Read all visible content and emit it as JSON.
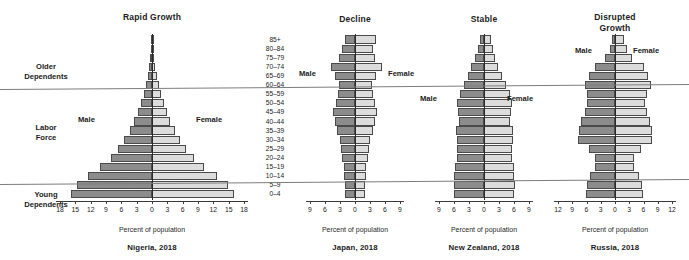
{
  "figure": {
    "shared_axis_label": "Percent of population",
    "series_names": {
      "male": "Male",
      "female": "Female"
    },
    "age_groups": [
      "85+",
      "80–84",
      "75–79",
      "70–74",
      "65–69",
      "60–64",
      "55–59",
      "50–54",
      "45–49",
      "40–44",
      "35–39",
      "30–34",
      "25–29",
      "20–24",
      "15–19",
      "10–14",
      "5–9",
      "0–4"
    ],
    "category_bands": [
      {
        "label": "Older\nDependents"
      },
      {
        "label": "Labor\nForce"
      },
      {
        "label": "Young\nDependents"
      }
    ],
    "colors": {
      "male": "#8c8c8c",
      "female": "#dcdcdc",
      "outline": "#4a4a4a",
      "axis": "#3a3a3a",
      "divider": "#7d7d7d"
    }
  },
  "chart_data": [
    {
      "type": "bar",
      "title": "Rapid Growth",
      "caption": "Nigeria, 2018",
      "xlabel": "Percent of population",
      "ylabel": "",
      "orientation": "population-pyramid",
      "xlim": [
        -18,
        18
      ],
      "xticks": [
        18,
        15,
        12,
        9,
        6,
        3,
        0,
        3,
        6,
        9,
        12,
        15,
        18
      ],
      "grid": false,
      "legend": [
        "Male",
        "Female"
      ],
      "categories": [
        "85+",
        "80–84",
        "75–79",
        "70–74",
        "65–69",
        "60–64",
        "55–59",
        "50–54",
        "45–49",
        "40–44",
        "35–39",
        "30–34",
        "25–29",
        "20–24",
        "15–19",
        "10–14",
        "5–9",
        "0–4"
      ],
      "series": [
        {
          "name": "Male",
          "values": [
            0.1,
            0.2,
            0.35,
            0.55,
            0.85,
            1.2,
            1.65,
            2.2,
            2.8,
            3.5,
            4.4,
            5.4,
            6.6,
            8.1,
            10.1,
            12.6,
            14.6,
            15.8
          ]
        },
        {
          "name": "Female",
          "values": [
            0.12,
            0.24,
            0.4,
            0.62,
            0.92,
            1.28,
            1.72,
            2.28,
            2.88,
            3.58,
            4.48,
            5.48,
            6.7,
            8.2,
            10.2,
            12.7,
            14.8,
            16.0
          ]
        }
      ]
    },
    {
      "type": "bar",
      "title": "Decline",
      "caption": "Japan, 2018",
      "xlabel": "Percent of population",
      "ylabel": "",
      "orientation": "population-pyramid",
      "xlim": [
        -9,
        9
      ],
      "xticks": [
        9,
        6,
        3,
        0,
        3,
        6,
        9
      ],
      "grid": false,
      "legend": [
        "Male",
        "Female"
      ],
      "categories": [
        "85+",
        "80–84",
        "75–79",
        "70–74",
        "65–69",
        "60–64",
        "55–59",
        "50–54",
        "45–49",
        "40–44",
        "35–39",
        "30–34",
        "25–29",
        "20–24",
        "15–19",
        "10–14",
        "5–9",
        "0–4"
      ],
      "series": [
        {
          "name": "Male",
          "values": [
            2.1,
            2.6,
            3.3,
            4.9,
            4.0,
            3.2,
            3.4,
            3.9,
            4.4,
            4.0,
            3.6,
            3.1,
            2.8,
            2.6,
            2.3,
            2.2,
            2.1,
            2.0
          ]
        },
        {
          "name": "Female",
          "values": [
            4.1,
            3.5,
            3.9,
            5.4,
            4.2,
            3.3,
            3.5,
            3.9,
            4.3,
            3.9,
            3.5,
            3.0,
            2.7,
            2.5,
            2.2,
            2.1,
            2.0,
            1.9
          ]
        }
      ]
    },
    {
      "type": "bar",
      "title": "Stable",
      "caption": "New Zealand, 2018",
      "xlabel": "Percent of population",
      "ylabel": "",
      "orientation": "population-pyramid",
      "xlim": [
        -9,
        9
      ],
      "xticks": [
        9,
        6,
        3,
        0,
        3,
        6,
        9
      ],
      "grid": false,
      "legend": [
        "Male",
        "Female"
      ],
      "categories": [
        "85+",
        "80–84",
        "75–79",
        "70–74",
        "65–69",
        "60–64",
        "55–59",
        "50–54",
        "45–49",
        "40–44",
        "35–39",
        "30–34",
        "25–29",
        "20–24",
        "15–19",
        "10–14",
        "5–9",
        "0–4"
      ],
      "series": [
        {
          "name": "Male",
          "values": [
            0.8,
            1.3,
            1.9,
            2.6,
            3.3,
            4.1,
            4.9,
            5.4,
            5.2,
            5.0,
            5.6,
            5.5,
            5.4,
            5.5,
            5.8,
            6.0,
            6.1,
            6.0
          ]
        },
        {
          "name": "Female",
          "values": [
            1.3,
            1.7,
            2.2,
            2.8,
            3.5,
            4.3,
            5.1,
            5.6,
            5.4,
            5.2,
            5.8,
            5.7,
            5.5,
            5.6,
            5.9,
            6.05,
            6.15,
            6.05
          ]
        }
      ]
    },
    {
      "type": "bar",
      "title": "Disrupted\nGrowth",
      "caption": "Russia, 2018",
      "xlabel": "Percent of population",
      "ylabel": "",
      "orientation": "population-pyramid",
      "xlim": [
        -12,
        12
      ],
      "xticks": [
        12,
        9,
        6,
        3,
        0,
        3,
        6,
        9,
        12
      ],
      "grid": false,
      "legend": [
        "Male",
        "Female"
      ],
      "categories": [
        "85+",
        "80–84",
        "75–79",
        "70–74",
        "65–69",
        "60–64",
        "55–59",
        "50–54",
        "45–49",
        "40–44",
        "35–39",
        "30–34",
        "25–29",
        "20–24",
        "15–19",
        "10–14",
        "5–9",
        "0–4"
      ],
      "series": [
        {
          "name": "Male",
          "values": [
            0.6,
            1.1,
            2.1,
            4.3,
            5.5,
            6.4,
            6.0,
            5.8,
            6.3,
            7.2,
            7.6,
            7.8,
            5.5,
            4.2,
            4.3,
            5.2,
            6.0,
            6.2
          ]
        },
        {
          "name": "Female",
          "values": [
            1.9,
            2.6,
            3.6,
            6.2,
            7.0,
            7.6,
            6.8,
            6.4,
            6.7,
            7.4,
            7.7,
            7.7,
            5.4,
            4.1,
            4.1,
            4.95,
            5.75,
            5.9
          ]
        }
      ]
    }
  ]
}
